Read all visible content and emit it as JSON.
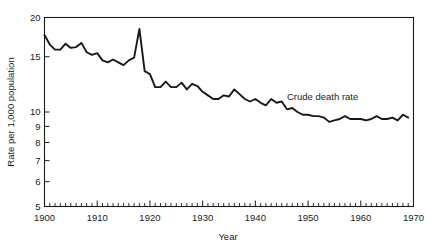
{
  "chart_data": {
    "type": "line",
    "title": "",
    "xlabel": "Year",
    "ylabel": "Rate per 1,000 population",
    "yscale": "log",
    "ylim": [
      5,
      20
    ],
    "xlim": [
      1900,
      1970
    ],
    "grid": false,
    "legend_position": "inline-annotation",
    "y_ticks": [
      20,
      15,
      10,
      9,
      8,
      7,
      6,
      5
    ],
    "y_tick_labels": [
      "20",
      "15",
      "10",
      "9",
      "8",
      "7",
      "6",
      "5"
    ],
    "x_ticks": [
      1900,
      1910,
      1920,
      1930,
      1940,
      1950,
      1960,
      1970
    ],
    "x_tick_labels": [
      "1900",
      "1910",
      "1920",
      "1930",
      "1940",
      "1950",
      "1960",
      "1970"
    ],
    "x_minor_tick_interval": 1,
    "annotations": [
      {
        "text": "Crude death rate",
        "x": 1946,
        "y": 10.9
      }
    ],
    "series": [
      {
        "name": "Crude death rate",
        "color": "#181818",
        "x": [
          1900,
          1901,
          1902,
          1903,
          1904,
          1905,
          1906,
          1907,
          1908,
          1909,
          1910,
          1911,
          1912,
          1913,
          1914,
          1915,
          1916,
          1917,
          1918,
          1919,
          1920,
          1921,
          1922,
          1923,
          1924,
          1925,
          1926,
          1927,
          1928,
          1929,
          1930,
          1931,
          1932,
          1933,
          1934,
          1935,
          1936,
          1937,
          1938,
          1939,
          1940,
          1941,
          1942,
          1943,
          1944,
          1945,
          1946,
          1947,
          1948,
          1949,
          1950,
          1951,
          1952,
          1953,
          1954,
          1955,
          1956,
          1957,
          1958,
          1959,
          1960,
          1961,
          1962,
          1963,
          1964,
          1965,
          1966,
          1967,
          1968,
          1969
        ],
        "values": [
          17.6,
          16.4,
          15.8,
          15.8,
          16.5,
          16.0,
          16.1,
          16.6,
          15.5,
          15.2,
          15.4,
          14.6,
          14.4,
          14.7,
          14.4,
          14.1,
          14.6,
          14.9,
          18.4,
          13.5,
          13.2,
          12.0,
          12.0,
          12.5,
          12.0,
          12.0,
          12.4,
          11.8,
          12.3,
          12.1,
          11.6,
          11.3,
          11.0,
          11.0,
          11.3,
          11.2,
          11.8,
          11.4,
          11.0,
          10.8,
          11.0,
          10.7,
          10.5,
          11.0,
          10.7,
          10.8,
          10.2,
          10.3,
          10.0,
          9.8,
          9.8,
          9.7,
          9.7,
          9.6,
          9.3,
          9.4,
          9.5,
          9.7,
          9.5,
          9.5,
          9.5,
          9.4,
          9.5,
          9.7,
          9.5,
          9.5,
          9.6,
          9.4,
          9.8,
          9.6
        ]
      }
    ]
  },
  "figure": {
    "ylabel": "Rate per 1,000 population",
    "xlabel": "Year",
    "series_label": "Crude death rate"
  }
}
